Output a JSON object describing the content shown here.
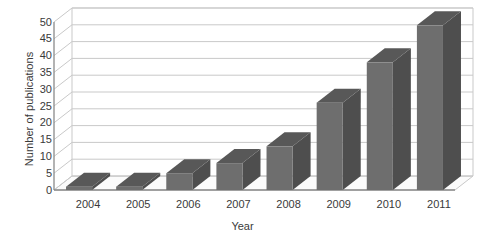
{
  "chart_data": {
    "type": "bar",
    "title": "",
    "subtitle": "",
    "xlabel": "Year",
    "ylabel": "Number of publications",
    "categories": [
      "2004",
      "2005",
      "2006",
      "2007",
      "2008",
      "2009",
      "2010",
      "2011"
    ],
    "values": [
      1,
      1,
      5,
      8,
      13,
      26,
      38,
      49
    ],
    "series": [
      {
        "name": "Number of publications",
        "values": [
          1,
          1,
          5,
          8,
          13,
          26,
          38,
          49
        ]
      }
    ],
    "ylim": [
      0,
      50
    ],
    "ytick_values": [
      0,
      5,
      10,
      15,
      20,
      25,
      30,
      35,
      40,
      45,
      50
    ],
    "ytick_labels": [
      "0",
      "5",
      "10",
      "15",
      "20",
      "25",
      "30",
      "35",
      "40",
      "45",
      "50"
    ],
    "xtick_labels": [
      "2004",
      "2005",
      "2006",
      "2007",
      "2008",
      "2009",
      "2010",
      "2011"
    ],
    "grid": true,
    "grid_axis": "y",
    "legend": false,
    "legend_position": "none",
    "three_d": true,
    "annotations": [],
    "colors": {
      "bar_front": "#6e6e6e",
      "bar_side": "#4e4e4e",
      "bar_top": "#585858",
      "gridline": "#c9c9c9",
      "axis": "#8a8a8a",
      "floor": "#fbfbfb",
      "text": "#3a3a3a",
      "background": "#ffffff"
    }
  }
}
